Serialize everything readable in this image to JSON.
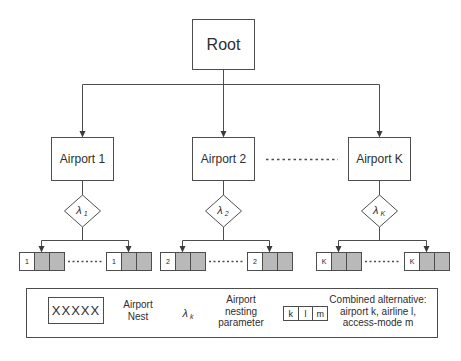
{
  "diagram": {
    "root": {
      "label": "Root"
    },
    "nests": [
      {
        "airport_label": "Airport 1",
        "lambda_symbol": "λ",
        "lambda_subscript": "1",
        "leaf_label": "1"
      },
      {
        "airport_label": "Airport 2",
        "lambda_symbol": "λ",
        "lambda_subscript": "2",
        "leaf_label": "2"
      },
      {
        "airport_label": "Airport K",
        "lambda_symbol": "λ",
        "lambda_subscript": "K",
        "leaf_label": "K"
      }
    ]
  },
  "legend": {
    "nest_box_label": "XXXXX",
    "nest_label": "Airport\nNest",
    "lambda_symbol": "λ",
    "lambda_subscript": "k",
    "nesting_label": "Airport\nnesting\nparameter",
    "combined_cells": [
      "k",
      "l",
      "m"
    ],
    "combined_label": "Combined alternative:\nairport k, airline l,\naccess-mode m"
  },
  "colors": {
    "line": "#4d4d4d",
    "leaf_gray": "#b9b9b9",
    "background": "#ffffff"
  }
}
